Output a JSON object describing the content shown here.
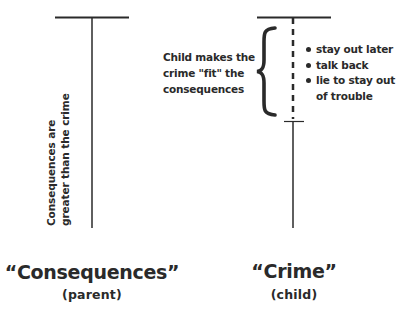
{
  "diagram": {
    "left": {
      "title": "“Consequences”",
      "subtitle": "(parent)",
      "vertical_note": [
        "Consequences are",
        "greater than the crime"
      ]
    },
    "right": {
      "title": "“Crime”",
      "subtitle": "(child)",
      "side_note": [
        "Child makes the",
        "crime \"fit\" the",
        "consequences"
      ],
      "bullets": [
        {
          "text": "stay out later"
        },
        {
          "text": "talk back"
        },
        {
          "text": "lie to stay out",
          "continuation": "of trouble"
        }
      ]
    },
    "colors": {
      "ink": "#2a2a2a",
      "background": "#ffffff"
    }
  }
}
